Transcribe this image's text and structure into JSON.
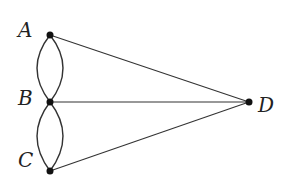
{
  "diagram": {
    "type": "graph",
    "nodes": [
      {
        "id": "A",
        "label": "A",
        "x": 50,
        "y": 35
      },
      {
        "id": "B",
        "label": "B",
        "x": 50,
        "y": 102
      },
      {
        "id": "C",
        "label": "C",
        "x": 50,
        "y": 171
      },
      {
        "id": "D",
        "label": "D",
        "x": 249,
        "y": 102
      }
    ],
    "edges": [
      {
        "from": "A",
        "to": "B",
        "style": "arc-left"
      },
      {
        "from": "A",
        "to": "B",
        "style": "arc-right"
      },
      {
        "from": "B",
        "to": "C",
        "style": "arc-left"
      },
      {
        "from": "B",
        "to": "C",
        "style": "arc-right"
      },
      {
        "from": "A",
        "to": "D",
        "style": "straight"
      },
      {
        "from": "B",
        "to": "D",
        "style": "straight"
      },
      {
        "from": "C",
        "to": "D",
        "style": "straight"
      }
    ],
    "colors": {
      "stroke": "#333333",
      "node": "#111111"
    }
  }
}
